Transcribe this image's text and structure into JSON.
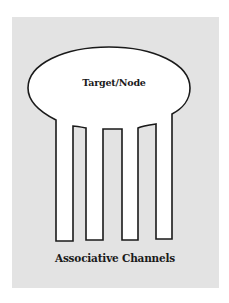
{
  "diagram": {
    "node": {
      "label": "Target/Node",
      "shape": "ellipse"
    },
    "channels": {
      "count": 4,
      "caption": "Associative Channels"
    },
    "colors": {
      "page_background": "#ffffff",
      "panel_background": "#e3e3e3",
      "shape_fill": "#ffffff",
      "stroke": "#1a1a1a",
      "text": "#1a1a1a"
    }
  }
}
